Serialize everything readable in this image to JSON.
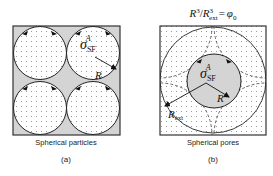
{
  "colors": {
    "border": "#333333",
    "gray_fill": "#d4d4d4",
    "white_fill": "#ffffff",
    "dots": "#8a8a8a",
    "dashed": "#444444"
  },
  "panel_a": {
    "caption": "Spherical particles",
    "sublabel": "(a)",
    "sigma_symbol": "σ",
    "sigma_sub": "SF",
    "sigma_sup": "A",
    "radius_label": "R"
  },
  "panel_b": {
    "equation": {
      "r": "R",
      "r_exp": "3",
      "slash": "/",
      "rext": "R",
      "rext_exp": "3",
      "rext_sub": "ext",
      "equals": "=",
      "phi": "φ",
      "phi_sub": "0"
    },
    "caption": "Spherical pores",
    "sublabel": "(b)",
    "sigma_symbol": "σ",
    "sigma_sub": "SF",
    "sigma_sup": "A",
    "radius_label": "R",
    "ext_radius_label": "R",
    "ext_radius_sub": "ext"
  }
}
